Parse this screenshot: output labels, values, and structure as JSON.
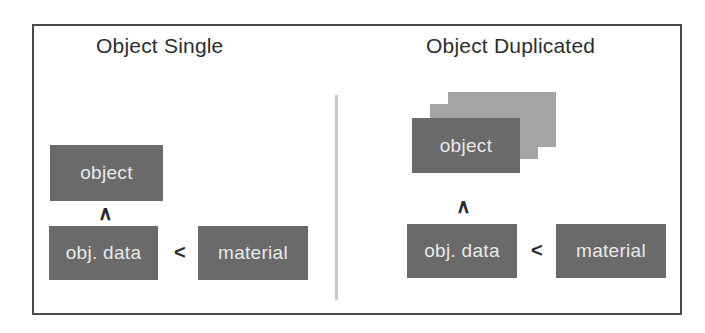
{
  "figure": {
    "frame_color": "#4a4a4a",
    "background": "#ffffff",
    "divider_color": "#c9c9c9",
    "node_color": "#6a6a6a",
    "ghost_node_color": "#a5a5a5",
    "node_text_color": "#e9e9e9",
    "glyph_color": "#2b2b2b"
  },
  "panels": [
    {
      "id": "object-single",
      "title": "Object Single",
      "nodes": [
        {
          "id": "object",
          "label": "object"
        },
        {
          "id": "obj-data",
          "label": "obj. data"
        },
        {
          "id": "material",
          "label": "material"
        }
      ],
      "relations": [
        {
          "id": "object-to-objdata",
          "glyph": "∧"
        },
        {
          "id": "objdata-to-material",
          "glyph": "<"
        }
      ]
    },
    {
      "id": "object-duplicated",
      "title": "Object Duplicated",
      "nodes": [
        {
          "id": "object-copy-2",
          "label": ""
        },
        {
          "id": "object-copy-1",
          "label": ""
        },
        {
          "id": "object",
          "label": "object"
        },
        {
          "id": "obj-data",
          "label": "obj. data"
        },
        {
          "id": "material",
          "label": "material"
        }
      ],
      "relations": [
        {
          "id": "object-to-objdata",
          "glyph": "∧"
        },
        {
          "id": "objdata-to-material",
          "glyph": "<"
        }
      ]
    }
  ]
}
